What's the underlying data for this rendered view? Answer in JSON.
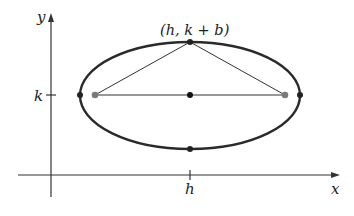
{
  "diagram": {
    "type": "ellipse-with-foci",
    "axes": {
      "x_label": "x",
      "y_label": "y"
    },
    "ticks": {
      "x_tick": "h",
      "y_tick": "k"
    },
    "top_vertex_label": "(h, k + b)",
    "points": [
      {
        "name": "left-vertex",
        "color": "#222222"
      },
      {
        "name": "left-focus",
        "color": "#7a7a7a"
      },
      {
        "name": "center",
        "color": "#111111"
      },
      {
        "name": "right-focus",
        "color": "#7a7a7a"
      },
      {
        "name": "right-vertex",
        "color": "#222222"
      },
      {
        "name": "top-vertex",
        "color": "#222222"
      },
      {
        "name": "bottom-vertex",
        "color": "#222222"
      }
    ],
    "colors": {
      "curve": "#2a2a2a",
      "axis": "#333333",
      "focus": "#7a7a7a"
    }
  }
}
